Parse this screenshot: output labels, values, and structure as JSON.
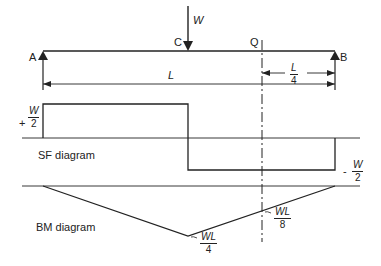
{
  "beam": {
    "support_left_label": "A",
    "support_right_label": "B",
    "load_point_label": "C",
    "load_label": "W",
    "section_label": "Q",
    "span_label": "L",
    "section_distance": {
      "num": "L",
      "den": "4"
    }
  },
  "sf_diagram": {
    "title": "SF diagram",
    "positive_value": {
      "sign": "+",
      "num": "W",
      "den": "2"
    },
    "negative_value": {
      "sign": "-",
      "num": "W",
      "den": "2"
    }
  },
  "bm_diagram": {
    "title": "BM diagram",
    "max_value": {
      "num": "WL",
      "den": "4"
    },
    "section_value": {
      "num": "WL",
      "den": "8"
    }
  },
  "colors": {
    "line": "#222222",
    "background": "#ffffff"
  }
}
